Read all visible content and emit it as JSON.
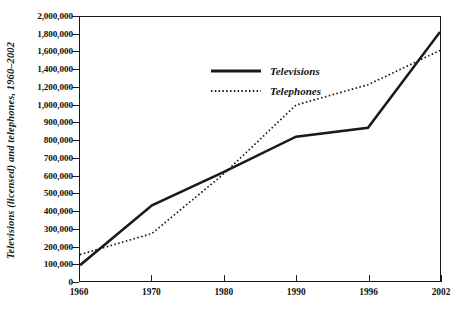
{
  "chart_data": {
    "type": "line",
    "title": "",
    "xlabel": "",
    "ylabel": "Televisions (licensed) and telephones, 1960–2002",
    "categories": [
      "1960",
      "1970",
      "1980",
      "1990",
      "1996",
      "2002"
    ],
    "axis_type": "categorical-x, piecewise-linear-y",
    "grid": false,
    "legend_position": "upper-left-inside",
    "ytick_labels": [
      "2,000,000",
      "1,800,000",
      "1,600,000",
      "1,400,000",
      "1,200,000",
      "1,000,000",
      "900,000",
      "800,000",
      "700,000",
      "600,000",
      "500,000",
      "400,000",
      "300,000",
      "200,000",
      "100,000",
      "0"
    ],
    "ytick_values": [
      2000000,
      1800000,
      1600000,
      1400000,
      1200000,
      1000000,
      900000,
      800000,
      700000,
      600000,
      500000,
      400000,
      300000,
      200000,
      100000,
      0
    ],
    "ylim": [
      0,
      2000000
    ],
    "series": [
      {
        "name": "Televisions",
        "style": "solid",
        "color": "#1a1a1a",
        "values": [
          90000,
          430000,
          620000,
          820000,
          870000,
          1830000
        ]
      },
      {
        "name": "Telephones",
        "style": "dotted",
        "color": "#1a1a1a",
        "values": [
          150000,
          270000,
          610000,
          1000000,
          1230000,
          1620000
        ]
      }
    ]
  },
  "legend": {
    "items": [
      {
        "label": "Televisions",
        "style": "solid"
      },
      {
        "label": "Telephones",
        "style": "dotted"
      }
    ]
  }
}
